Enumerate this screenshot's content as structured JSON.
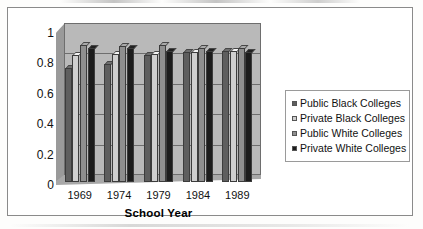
{
  "figure": {
    "has_border": true,
    "background": "#ffffff"
  },
  "chart_data": {
    "type": "bar",
    "title": "",
    "xlabel": "School Year",
    "ylabel": "",
    "categories": [
      "1969",
      "1974",
      "1979",
      "1984",
      "1989"
    ],
    "series": [
      {
        "name": "Public Black Colleges",
        "color": "#5e5e5e",
        "values": [
          0.75,
          0.77,
          0.83,
          0.85,
          0.86
        ]
      },
      {
        "name": "Private Black Colleges",
        "color": "#cfcfcf",
        "values": [
          0.83,
          0.84,
          0.84,
          0.85,
          0.86
        ]
      },
      {
        "name": "Public White Colleges",
        "color": "#8f8f8f",
        "values": [
          0.9,
          0.89,
          0.9,
          0.88,
          0.88
        ]
      },
      {
        "name": "Private White Colleges",
        "color": "#1c1c1c",
        "values": [
          0.88,
          0.88,
          0.86,
          0.86,
          0.85
        ]
      }
    ],
    "ylim": [
      0,
      1
    ],
    "yticks": [
      "0",
      "0.2",
      "0.4",
      "0.6",
      "0.8",
      "1"
    ],
    "ytick_values": [
      0,
      0.2,
      0.4,
      0.6,
      0.8,
      1
    ],
    "grid": true,
    "grid_axis": "y",
    "legend_position": "right",
    "style": "3d-clustered-column",
    "plot_background": "#b9b9b9"
  },
  "legend": {
    "items": [
      {
        "label": "Public Black Colleges",
        "color": "#5e5e5e"
      },
      {
        "label": "Private Black Colleges",
        "color": "#cfcfcf"
      },
      {
        "label": "Public White Colleges",
        "color": "#8f8f8f"
      },
      {
        "label": "Private White Colleges",
        "color": "#1c1c1c"
      }
    ]
  }
}
